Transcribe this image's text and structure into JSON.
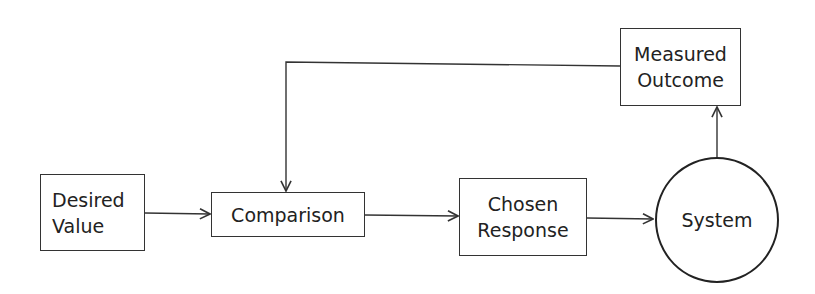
{
  "diagram": {
    "type": "feedback-loop flowchart",
    "nodes": [
      {
        "id": "desired",
        "shape": "rectangle",
        "lines": [
          "Desired",
          "Value"
        ]
      },
      {
        "id": "comparison",
        "shape": "rectangle",
        "lines": [
          "Comparison"
        ]
      },
      {
        "id": "chosen",
        "shape": "rectangle",
        "lines": [
          "Chosen",
          "Response"
        ]
      },
      {
        "id": "system",
        "shape": "circle",
        "lines": [
          "System"
        ]
      },
      {
        "id": "measured",
        "shape": "rectangle",
        "lines": [
          "Measured",
          "Outcome"
        ]
      }
    ],
    "edges": [
      {
        "from": "desired",
        "to": "comparison"
      },
      {
        "from": "comparison",
        "to": "chosen"
      },
      {
        "from": "chosen",
        "to": "system"
      },
      {
        "from": "system",
        "to": "measured"
      },
      {
        "from": "measured",
        "to": "comparison",
        "route": "feedback over top"
      }
    ],
    "colors": {
      "stroke": "#333333",
      "background": "#ffffff",
      "text": "#222222"
    }
  }
}
